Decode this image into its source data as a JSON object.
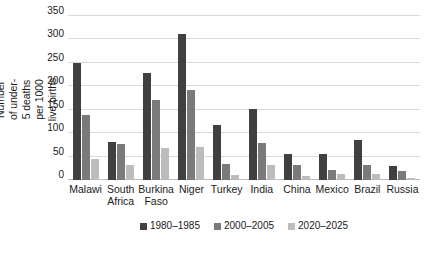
{
  "chart_data": {
    "type": "bar",
    "title": "",
    "subtitle": "",
    "xlabel": "",
    "ylabel": "Number of under-5 deaths per 1000 live births",
    "ylim": [
      0,
      350
    ],
    "yticks": [
      0,
      50,
      100,
      150,
      200,
      250,
      300,
      350
    ],
    "grid": "horizontal",
    "legend_position": "bottom-center",
    "categories": [
      "Malawi",
      "South Africa",
      "Burkina Faso",
      "Niger",
      "Turkey",
      "India",
      "China",
      "Mexico",
      "Brazil",
      "Russia"
    ],
    "series": [
      {
        "name": "1980–1985",
        "color": "#404040",
        "values": [
          250,
          81,
          228,
          312,
          117,
          152,
          56,
          56,
          86,
          30
        ]
      },
      {
        "name": "2000–2005",
        "color": "#7a7a7a",
        "values": [
          138,
          76,
          171,
          193,
          34,
          80,
          33,
          22,
          33,
          19
        ]
      },
      {
        "name": "2020–2025",
        "color": "#bcbcbc",
        "values": [
          45,
          31,
          69,
          71,
          10,
          32,
          9,
          13,
          12,
          4
        ]
      }
    ]
  },
  "colors": {
    "background": "#ffffff",
    "gridline": "#d9d9d9",
    "baseline": "#bdbdbd",
    "text": "#1a1a1a"
  }
}
